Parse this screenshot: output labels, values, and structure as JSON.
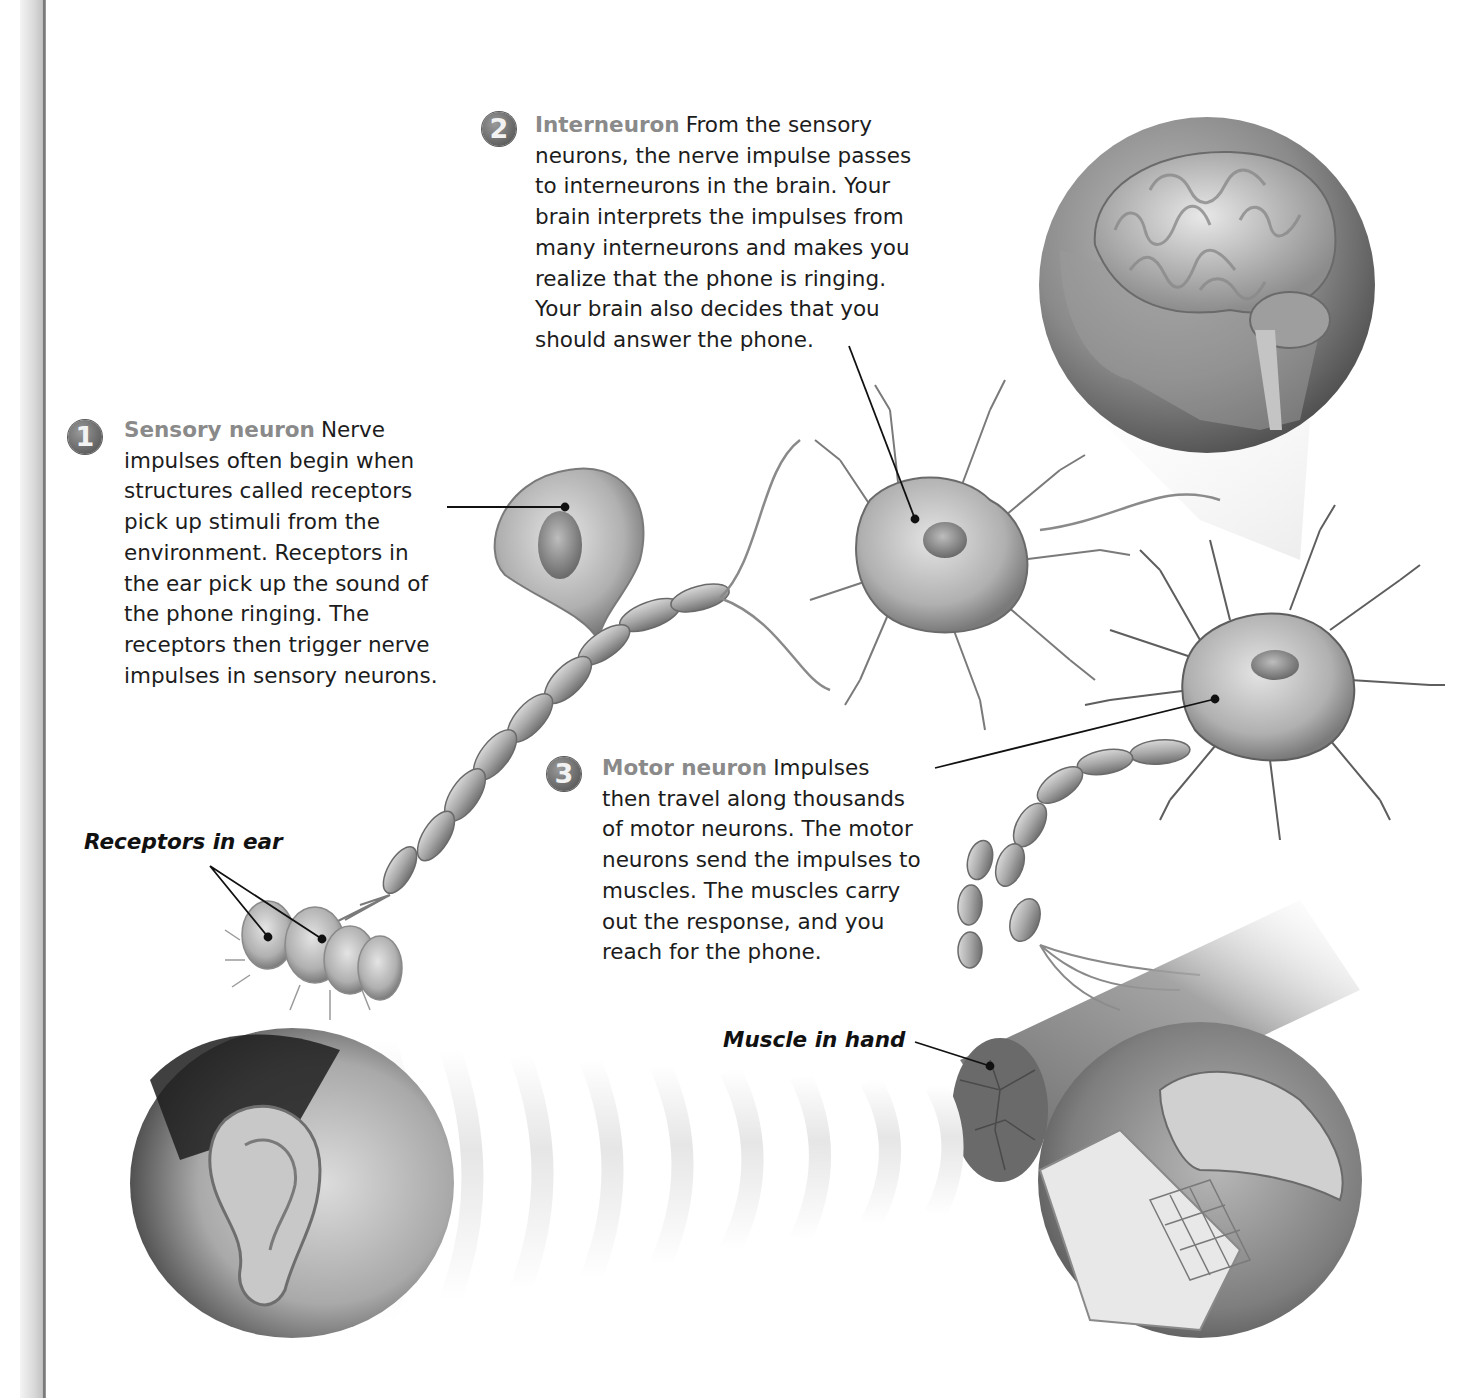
{
  "figure": {
    "steps": [
      {
        "number": "1",
        "term": "Sensory neuron",
        "text": "Nerve impulses often begin when structures called receptors pick up stimuli from the environment. Receptors in the ear pick up the sound of the phone ringing. The receptors then trigger nerve impulses in sensory neurons.",
        "lines": [
          "impulses often begin when",
          "structures called receptors",
          "pick up stimuli from the",
          "environment. Receptors in",
          "the ear pick up the sound of",
          "the phone ringing. The",
          "receptors then trigger nerve",
          "impulses in sensory neurons."
        ],
        "first_line_tail": "Nerve"
      },
      {
        "number": "2",
        "term": "Interneuron",
        "text": "From the sensory neurons, the nerve impulse passes to interneurons in the brain. Your brain interprets the impulses from many interneurons and makes you realize that the phone is ringing. Your brain also decides that you should answer the phone.",
        "lines": [
          "neurons, the nerve impulse passes",
          "to interneurons in the brain. Your",
          "brain interprets the impulses from",
          "many interneurons and makes you",
          "realize that the phone is ringing.",
          "Your brain also decides that you",
          "should answer the phone."
        ],
        "first_line_tail": "From the sensory"
      },
      {
        "number": "3",
        "term": "Motor neuron",
        "text": "Impulses then travel along thousands of motor neurons. The motor neurons send the impulses to muscles. The muscles carry out the response, and you reach for the phone.",
        "lines": [
          "then travel along thousands",
          "of motor neurons. The motor",
          "neurons send the impulses to",
          "muscles. The muscles carry",
          "out the response, and you",
          "reach for the phone."
        ],
        "first_line_tail": "Impulses"
      }
    ],
    "labels": {
      "receptors": "Receptors in ear",
      "muscle": "Muscle in hand"
    },
    "illustrations": {
      "brain": "brain-in-head-circle",
      "ear": "ear-circle",
      "hand_phone": "hand-on-phone-circle",
      "sound_waves": "sound-wave-arcs",
      "sensory_neuron": "unipolar-sensory-neuron",
      "interneuron": "multipolar-interneuron",
      "motor_neuron": "multipolar-motor-neuron",
      "muscle": "muscle-fiber-bundle"
    },
    "colors": {
      "term": "#8a8a8a",
      "body_text": "#1c1c1c",
      "badge": "#6e6e6e",
      "binding": "#c4c4c4"
    }
  }
}
